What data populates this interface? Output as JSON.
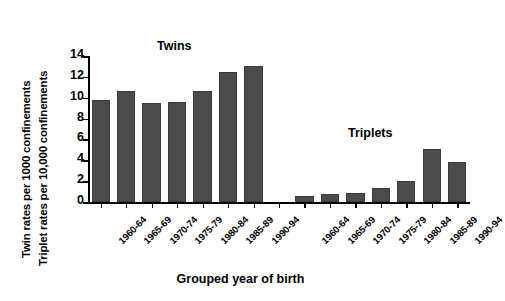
{
  "chart_data": {
    "type": "bar",
    "title": "",
    "xlabel": "Grouped year of birth",
    "ylabel_line1": "Twin rates per 1000 confinements",
    "ylabel_line2": "Triplet rates per 10,000 confinements",
    "ylim": [
      0,
      14
    ],
    "yticks": [
      0,
      2,
      4,
      6,
      8,
      10,
      12,
      14
    ],
    "ytick_labels": [
      "0",
      "2",
      "4",
      "6",
      "8",
      "10",
      "12",
      "14"
    ],
    "grid": false,
    "legend": "none",
    "bar_color": "#4b4b4b",
    "axis_color": "#000000",
    "background": "#ffffff",
    "groups": [
      {
        "name": "Twins",
        "annotation": "Twins",
        "units": "per 1000 confinements",
        "categories": [
          "1960-64",
          "1965-69",
          "1970-74",
          "1975-79",
          "1980-84",
          "1985-89",
          "1990-94"
        ],
        "values": [
          9.8,
          10.6,
          9.5,
          9.55,
          10.6,
          12.5,
          13.05
        ]
      },
      {
        "name": "Triplets",
        "annotation": "Triplets",
        "units": "per 10,000 confinements",
        "categories": [
          "1960-64",
          "1965-69",
          "1970-74",
          "1975-79",
          "1980-84",
          "1985-89",
          "1990-94"
        ],
        "values": [
          0.6,
          0.8,
          0.85,
          1.3,
          2.0,
          5.1,
          3.85
        ]
      }
    ]
  }
}
